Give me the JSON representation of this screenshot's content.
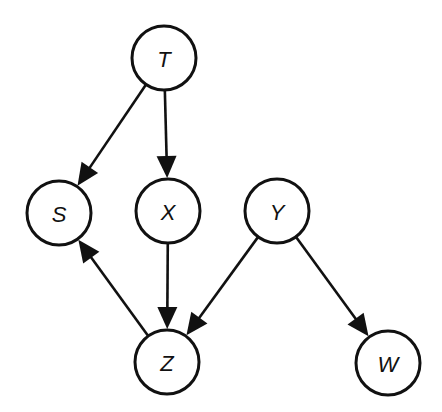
{
  "diagram": {
    "type": "directed-acyclic-graph",
    "colors": {
      "stroke": "#111111",
      "fill": "#ffffff"
    },
    "node_radius": 32,
    "nodes": [
      {
        "id": "T",
        "label": "T",
        "x": 164,
        "y": 58
      },
      {
        "id": "S",
        "label": "S",
        "x": 59,
        "y": 213
      },
      {
        "id": "X",
        "label": "X",
        "x": 168,
        "y": 211
      },
      {
        "id": "Y",
        "label": "Y",
        "x": 277,
        "y": 211
      },
      {
        "id": "Z",
        "label": "Z",
        "x": 167,
        "y": 362
      },
      {
        "id": "W",
        "label": "W",
        "x": 388,
        "y": 363
      }
    ],
    "edges": [
      {
        "from": "T",
        "to": "S"
      },
      {
        "from": "T",
        "to": "X"
      },
      {
        "from": "X",
        "to": "Z"
      },
      {
        "from": "Z",
        "to": "S"
      },
      {
        "from": "Y",
        "to": "Z"
      },
      {
        "from": "Y",
        "to": "W"
      }
    ]
  }
}
